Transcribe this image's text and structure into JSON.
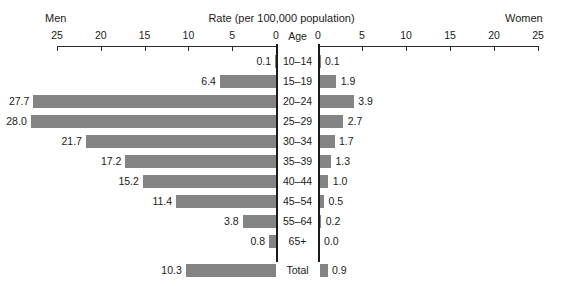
{
  "header": {
    "left_group_label": "Men",
    "title": "Rate (per 100,000 population)",
    "right_group_label": "Women",
    "center_column_label": "Age"
  },
  "axes": {
    "left_ticks": [
      "25",
      "20",
      "15",
      "10",
      "5",
      "0"
    ],
    "right_ticks": [
      "0",
      "5",
      "10",
      "15",
      "20",
      "25"
    ],
    "max": 25,
    "min": 0
  },
  "chart_data": {
    "type": "bar",
    "title": "Rate (per 100,000 population)",
    "xlabel": "Rate (per 100,000 population)",
    "ylabel": "Age",
    "xlim": [
      0,
      25
    ],
    "grid": false,
    "legend_position": "top",
    "orientation": "horizontal-bilateral",
    "categories": [
      "10–14",
      "15–19",
      "20–24",
      "25–29",
      "30–34",
      "35–39",
      "40–44",
      "45–54",
      "55–64",
      "65+",
      "Total"
    ],
    "series": [
      {
        "name": "Men",
        "side": "left",
        "values": [
          0.1,
          6.4,
          27.7,
          28.0,
          21.7,
          17.2,
          15.2,
          11.4,
          3.8,
          0.8,
          10.3
        ],
        "labels": [
          "0.1",
          "6.4",
          "27.7",
          "28.0",
          "21.7",
          "17.2",
          "15.2",
          "11.4",
          "3.8",
          "0.8",
          "10.3"
        ]
      },
      {
        "name": "Women",
        "side": "right",
        "values": [
          0.1,
          1.9,
          3.9,
          2.7,
          1.7,
          1.3,
          1.0,
          0.5,
          0.2,
          0.0,
          0.9
        ],
        "labels": [
          "0.1",
          "1.9",
          "3.9",
          "2.7",
          "1.7",
          "1.3",
          "1.0",
          "0.5",
          "0.2",
          "0.0",
          "0.9"
        ]
      }
    ],
    "bar_color": "#848484",
    "axis_color": "#2b2b2b",
    "background": "#ffffff"
  }
}
